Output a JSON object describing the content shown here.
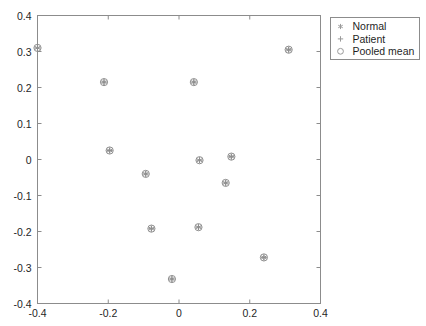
{
  "chart_data": {
    "type": "scatter",
    "title": "",
    "xlabel": "",
    "ylabel": "",
    "xlim": [
      -0.4,
      0.4
    ],
    "ylim": [
      -0.4,
      0.4
    ],
    "grid": false,
    "legend_position": "outside-top-right",
    "xticks": [
      "-0.4",
      "-0.2",
      "0",
      "0.2",
      "0.4"
    ],
    "xtick_values": [
      -0.4,
      -0.2,
      0,
      0.2,
      0.4
    ],
    "yticks": [
      "0.4",
      "0.3",
      "0.2",
      "0.1",
      "0",
      "-0.1",
      "-0.2",
      "-0.3",
      "-0.4"
    ],
    "ytick_values": [
      0.4,
      0.3,
      0.2,
      0.1,
      0,
      -0.1,
      -0.2,
      -0.3,
      -0.4
    ],
    "series": [
      {
        "name": "Normal",
        "marker": "asterisk",
        "color": "#8f8f8f",
        "points": [
          {
            "x": -0.4,
            "y": 0.31
          },
          {
            "x": -0.212,
            "y": 0.215
          },
          {
            "x": 0.042,
            "y": 0.215
          },
          {
            "x": 0.31,
            "y": 0.305
          },
          {
            "x": -0.196,
            "y": 0.025
          },
          {
            "x": 0.058,
            "y": -0.002
          },
          {
            "x": 0.148,
            "y": 0.008
          },
          {
            "x": -0.094,
            "y": -0.04
          },
          {
            "x": 0.132,
            "y": -0.065
          },
          {
            "x": -0.078,
            "y": -0.192
          },
          {
            "x": 0.055,
            "y": -0.188
          },
          {
            "x": 0.24,
            "y": -0.272
          },
          {
            "x": -0.02,
            "y": -0.332
          }
        ]
      },
      {
        "name": "Patient",
        "marker": "plus",
        "color": "#8f8f8f",
        "points": [
          {
            "x": -0.4,
            "y": 0.31
          },
          {
            "x": -0.212,
            "y": 0.215
          },
          {
            "x": 0.042,
            "y": 0.215
          },
          {
            "x": 0.31,
            "y": 0.305
          },
          {
            "x": -0.196,
            "y": 0.025
          },
          {
            "x": 0.058,
            "y": -0.002
          },
          {
            "x": 0.148,
            "y": 0.008
          },
          {
            "x": -0.094,
            "y": -0.04
          },
          {
            "x": 0.132,
            "y": -0.065
          },
          {
            "x": -0.078,
            "y": -0.192
          },
          {
            "x": 0.055,
            "y": -0.188
          },
          {
            "x": 0.24,
            "y": -0.272
          },
          {
            "x": -0.02,
            "y": -0.332
          }
        ]
      },
      {
        "name": "Pooled mean",
        "marker": "circle",
        "color": "#8f8f8f",
        "points": [
          {
            "x": -0.4,
            "y": 0.31
          },
          {
            "x": -0.212,
            "y": 0.215
          },
          {
            "x": 0.042,
            "y": 0.215
          },
          {
            "x": 0.31,
            "y": 0.305
          },
          {
            "x": -0.196,
            "y": 0.025
          },
          {
            "x": 0.058,
            "y": -0.002
          },
          {
            "x": 0.148,
            "y": 0.008
          },
          {
            "x": -0.094,
            "y": -0.04
          },
          {
            "x": 0.132,
            "y": -0.065
          },
          {
            "x": -0.078,
            "y": -0.192
          },
          {
            "x": 0.055,
            "y": -0.188
          },
          {
            "x": 0.24,
            "y": -0.272
          },
          {
            "x": -0.02,
            "y": -0.332
          }
        ]
      }
    ]
  },
  "legend": {
    "entries": [
      {
        "label": "Normal",
        "marker": "asterisk-icon"
      },
      {
        "label": "Patient",
        "marker": "plus-icon"
      },
      {
        "label": "Pooled mean",
        "marker": "circle-icon"
      }
    ]
  },
  "colors": {
    "axis": "#8c8c8c",
    "marker": "#8f8f8f",
    "text": "#1f1f1f",
    "background": "#ffffff"
  }
}
